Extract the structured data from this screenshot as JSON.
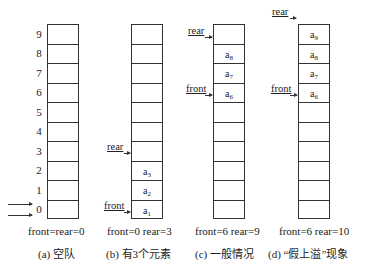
{
  "index_labels": [
    "9",
    "8",
    "7",
    "6",
    "5",
    "4",
    "3",
    "2",
    "1",
    "0"
  ],
  "panels": [
    {
      "id": "a",
      "cells_top_to_bottom": [
        "",
        "",
        "",
        "",
        "",
        "",
        "",
        "",
        "",
        ""
      ],
      "pointers": [],
      "state": "front=rear=0",
      "caption": "(a) 空队"
    },
    {
      "id": "b",
      "cells_top_to_bottom": [
        "",
        "",
        "",
        "",
        "",
        "",
        "",
        "a3",
        "a2",
        "a1"
      ],
      "pointers": [
        {
          "label": "rear",
          "index": 3
        },
        {
          "label": "front",
          "index": 0
        }
      ],
      "rear_label": "rear",
      "front_label": "front",
      "state": "front=0  rear=3",
      "caption": "(b) 有3个元素"
    },
    {
      "id": "c",
      "cells_top_to_bottom": [
        "",
        "a8",
        "a7",
        "a6",
        "",
        "",
        "",
        "",
        "",
        ""
      ],
      "rear_label": "rear",
      "front_label": "front",
      "state": "front=6 rear=9",
      "caption": "(c) 一般情况"
    },
    {
      "id": "d",
      "cells_top_to_bottom": [
        "a9",
        "a8",
        "a7",
        "a6",
        "",
        "",
        "",
        "",
        "",
        ""
      ],
      "rear_label": "rear",
      "front_label": "front",
      "state": "front=6 rear=10",
      "caption": "(d) “假上溢”现象"
    }
  ],
  "cell_texts": {
    "b": {
      "c7": "a",
      "c7s": "3",
      "c8": "a",
      "c8s": "2",
      "c9": "a",
      "c9s": "1"
    },
    "c": {
      "c1": "a",
      "c1s": "8",
      "c2": "a",
      "c2s": "7",
      "c3": "a",
      "c3s": "6"
    },
    "d": {
      "c0": "a",
      "c0s": "9",
      "c1": "a",
      "c1s": "8",
      "c2": "a",
      "c2s": "7",
      "c3": "a",
      "c3s": "6"
    }
  }
}
